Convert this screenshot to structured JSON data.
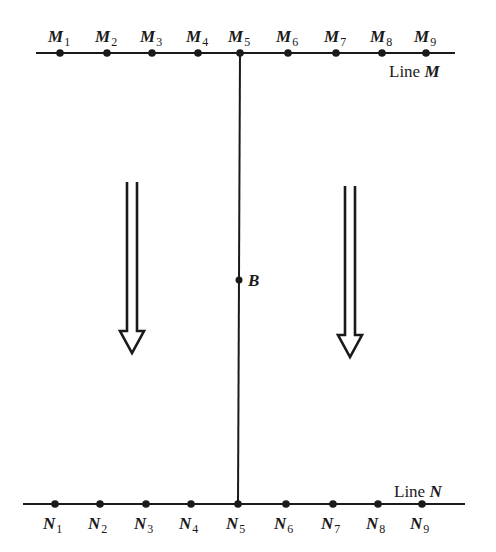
{
  "diagram": {
    "line_m": {
      "label_prefix": "Line ",
      "label_var": "M",
      "y": 53,
      "x_start": 36,
      "x_end": 455,
      "points": [
        {
          "name": "M",
          "sub": "1",
          "x": 60
        },
        {
          "name": "M",
          "sub": "2",
          "x": 107
        },
        {
          "name": "M",
          "sub": "3",
          "x": 152
        },
        {
          "name": "M",
          "sub": "4",
          "x": 198
        },
        {
          "name": "M",
          "sub": "5",
          "x": 240
        },
        {
          "name": "M",
          "sub": "6",
          "x": 288
        },
        {
          "name": "M",
          "sub": "7",
          "x": 336
        },
        {
          "name": "M",
          "sub": "8",
          "x": 382
        },
        {
          "name": "M",
          "sub": "9",
          "x": 426
        }
      ]
    },
    "line_n": {
      "label_prefix": "Line ",
      "label_var": "N",
      "y": 504,
      "x_start": 23,
      "x_end": 465,
      "points": [
        {
          "name": "N",
          "sub": "1",
          "x": 55
        },
        {
          "name": "N",
          "sub": "2",
          "x": 100
        },
        {
          "name": "N",
          "sub": "3",
          "x": 146
        },
        {
          "name": "N",
          "sub": "4",
          "x": 191
        },
        {
          "name": "N",
          "sub": "5",
          "x": 238
        },
        {
          "name": "N",
          "sub": "6",
          "x": 286
        },
        {
          "name": "N",
          "sub": "7",
          "x": 333
        },
        {
          "name": "N",
          "sub": "8",
          "x": 378
        },
        {
          "name": "N",
          "sub": "9",
          "x": 422
        }
      ]
    },
    "connector": {
      "x_top": 240,
      "x_bottom": 238
    },
    "point_b": {
      "label": "B",
      "x": 239,
      "y": 280
    },
    "arrows": [
      {
        "name": "left-arrow",
        "x": 132,
        "y_top": 182,
        "y_bottom": 353,
        "direction": "down"
      },
      {
        "name": "right-arrow",
        "x": 350,
        "y_top": 186,
        "y_bottom": 357,
        "direction": "down"
      }
    ],
    "colors": {
      "ink": "#1a1a1a",
      "background": "#ffffff"
    }
  }
}
